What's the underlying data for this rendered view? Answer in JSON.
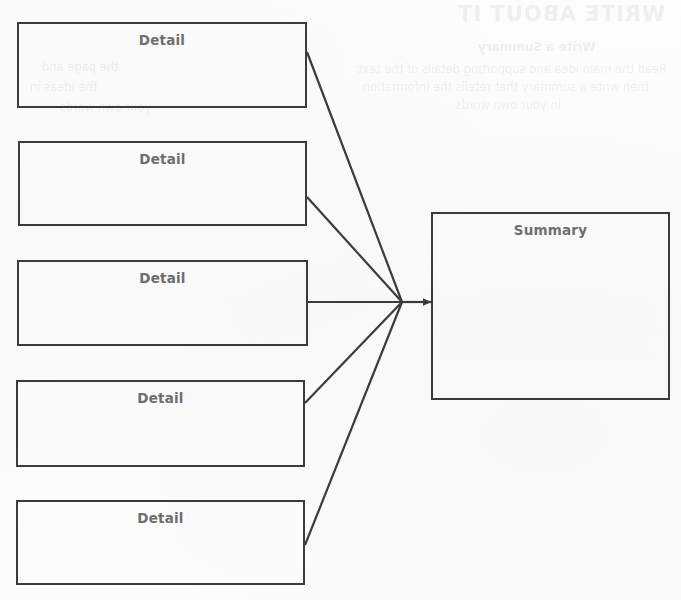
{
  "diagram": {
    "type": "convergence-flow",
    "background_color": "#fcfcfc",
    "stroke_color": "#3b3b3b",
    "label_color": "#6e6e6e",
    "detail_label": "Detail",
    "summary_label": "Summary",
    "nodes": [
      {
        "id": "detail-1",
        "label": "Detail",
        "x": 17,
        "y": 22,
        "width": 290,
        "height": 86
      },
      {
        "id": "detail-2",
        "label": "Detail",
        "x": 18,
        "y": 141,
        "width": 289,
        "height": 85
      },
      {
        "id": "detail-3",
        "label": "Detail",
        "x": 17,
        "y": 260,
        "width": 291,
        "height": 86
      },
      {
        "id": "detail-4",
        "label": "Detail",
        "x": 16,
        "y": 380,
        "width": 289,
        "height": 87
      },
      {
        "id": "detail-5",
        "label": "Detail",
        "x": 16,
        "y": 500,
        "width": 289,
        "height": 85
      },
      {
        "id": "summary",
        "label": "Summary",
        "x": 431,
        "y": 212,
        "width": 239,
        "height": 188
      }
    ],
    "converge_point": {
      "x": 402,
      "y": 302
    },
    "arrow_tip": {
      "x": 431,
      "y": 302
    },
    "edges": [
      {
        "from": "detail-1",
        "to": "summary",
        "start_x": 307,
        "start_y": 52
      },
      {
        "from": "detail-2",
        "to": "summary",
        "start_x": 307,
        "start_y": 197
      },
      {
        "from": "detail-3",
        "to": "summary",
        "start_x": 308,
        "start_y": 302
      },
      {
        "from": "detail-4",
        "to": "summary",
        "start_x": 305,
        "start_y": 403
      },
      {
        "from": "detail-5",
        "to": "summary",
        "start_x": 305,
        "start_y": 545
      }
    ]
  },
  "bleed_through": {
    "note": "faint illegible show-through text from the reverse of the scanned page",
    "heading": "WRITE ABOUT IT",
    "subheading": "Write a Summary",
    "line_1": "Read the main idea and supporting details of the text",
    "line_2": "then write a summary that retells the information",
    "line_3": "in your own words.",
    "left_1": "the page and",
    "left_2": "the ideas in",
    "left_3": "your own words"
  }
}
